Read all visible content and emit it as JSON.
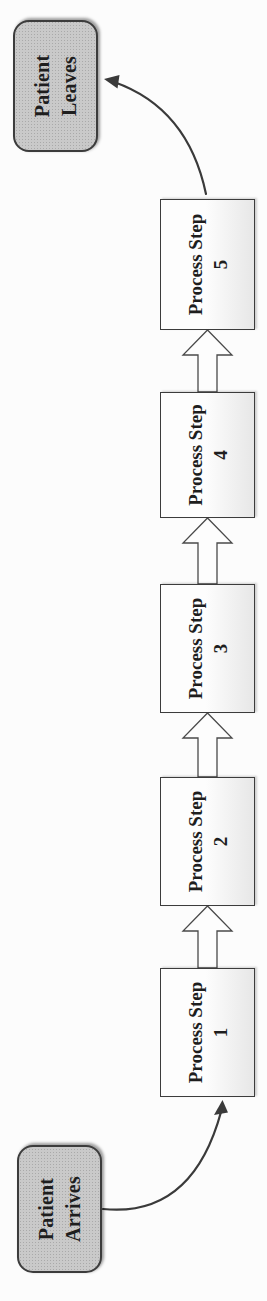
{
  "page": {
    "background": "#fcfcfc"
  },
  "colors": {
    "page-bg": "#fcfcfc",
    "text": "#1e1e1e",
    "node-border": "#3c3c3c",
    "node-fill": "#c9c9c9",
    "node-dot": "#a9a9a9",
    "step-fill-top": "#fdfdfd",
    "step-fill-bottom": "#e7e7e7",
    "arrow-line": "#3a3a3a",
    "block-arrow-fill": "#fdfdfd",
    "block-arrow-stroke": "#4a4a4a"
  },
  "diagram": {
    "type": "flowchart",
    "start_node": {
      "line1": "Patient",
      "line2": "Arrives"
    },
    "end_node": {
      "line1": "Patient",
      "line2": "Leaves"
    },
    "steps": [
      {
        "line1": "Process Step",
        "line2": "1"
      },
      {
        "line1": "Process Step",
        "line2": "2"
      },
      {
        "line1": "Process Step",
        "line2": "3"
      },
      {
        "line1": "Process Step",
        "line2": "4"
      },
      {
        "line1": "Process Step",
        "line2": "5"
      }
    ]
  }
}
